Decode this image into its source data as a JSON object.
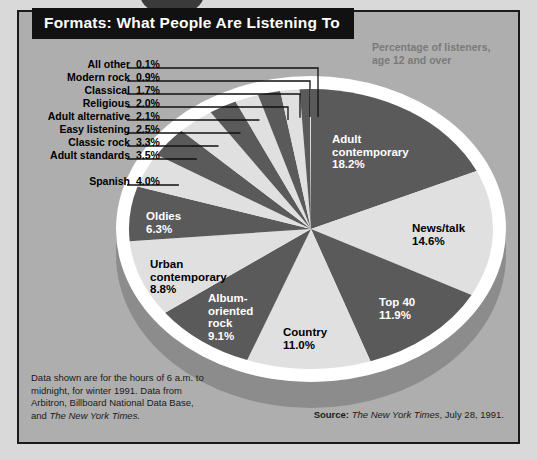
{
  "title": "Formats: What People Are Listening To",
  "subtitle": "Percentage of listeners,\nage 12 and over",
  "subtitle_line1": "Percentage of listeners,",
  "subtitle_line2": "age 12 and over",
  "footnote": "Data shown are for the hours of 6 a.m. to midnight, for winter 1991. Data from Arbitron, Billboard National Data Base, and ",
  "footnote_italic": "The New York Times.",
  "source_label": "Source:",
  "source_italic": "The New York Times",
  "source_rest": ", July 28, 1991.",
  "colors": {
    "panel_background": "#aeaeae",
    "page_background": "#d9d9d9",
    "slice_dark": "#5a5a5a",
    "slice_light": "#e0e0e0",
    "pie_rim": "#ffffff",
    "pie_side": "#8c8c8c",
    "title_background": "#111111",
    "title_text": "#ffffff",
    "subtitle_text": "#7a7a7a",
    "leader_line": "#111111"
  },
  "left_labels": [
    {
      "name": "All other",
      "value": "0.1%"
    },
    {
      "name": "Modern rock",
      "value": "0.9%"
    },
    {
      "name": "Classical",
      "value": "1.7%"
    },
    {
      "name": "Religious",
      "value": "2.0%"
    },
    {
      "name": "Adult alternative",
      "value": "2.1%"
    },
    {
      "name": "Easy listening",
      "value": "2.5%"
    },
    {
      "name": "Classic rock",
      "value": "3.3%"
    },
    {
      "name": "Adult standards",
      "value": "3.5%"
    },
    {
      "name": "Spanish",
      "value": "4.0%"
    }
  ],
  "slice_labels": [
    {
      "id": "adult-contemporary",
      "line1": "Adult",
      "line2": "contemporary",
      "line3": "18.2%",
      "tone": "w"
    },
    {
      "id": "news-talk",
      "line1": "News/talk",
      "line2": "14.6%",
      "line3": "",
      "tone": "b"
    },
    {
      "id": "top-40",
      "line1": "Top 40",
      "line2": "11.9%",
      "line3": "",
      "tone": "w"
    },
    {
      "id": "country",
      "line1": "Country",
      "line2": "11.0%",
      "line3": "",
      "tone": "b"
    },
    {
      "id": "album-oriented-rock",
      "line1": "Album-",
      "line2": "oriented",
      "line3": "rock",
      "line4": "9.1%",
      "tone": "w"
    },
    {
      "id": "urban-contemporary",
      "line1": "Urban",
      "line2": "contemporary",
      "line3": "8.8%",
      "tone": "b"
    },
    {
      "id": "oldies",
      "line1": "Oldies",
      "line2": "6.3%",
      "line3": "",
      "tone": "w"
    }
  ],
  "chart_data": {
    "type": "pie",
    "title": "Formats: What People Are Listening To",
    "subtitle": "Percentage of listeners, age 12 and over",
    "unit": "percent",
    "legend": "labels on slices and leader lines",
    "categories": [
      "Adult contemporary",
      "News/talk",
      "Top 40",
      "Country",
      "Album-oriented rock",
      "Urban contemporary",
      "Oldies",
      "Spanish",
      "Adult standards",
      "Classic rock",
      "Easy listening",
      "Adult alternative",
      "Religious",
      "Classical",
      "Modern rock",
      "All other"
    ],
    "values": [
      18.2,
      14.6,
      11.9,
      11.0,
      9.1,
      8.8,
      6.3,
      4.0,
      3.5,
      3.3,
      2.5,
      2.1,
      2.0,
      1.7,
      0.9,
      0.1
    ],
    "value_labels": [
      "18.2%",
      "14.6%",
      "11.9%",
      "11.0%",
      "9.1%",
      "8.8%",
      "6.3%",
      "4.0%",
      "3.5%",
      "3.3%",
      "2.5%",
      "2.1%",
      "2.0%",
      "1.7%",
      "0.9%",
      "0.1%"
    ],
    "slice_colors": [
      "#5a5a5a",
      "#e0e0e0",
      "#5a5a5a",
      "#e0e0e0",
      "#5a5a5a",
      "#e0e0e0",
      "#5a5a5a",
      "#e0e0e0",
      "#5a5a5a",
      "#e0e0e0",
      "#5a5a5a",
      "#e0e0e0",
      "#5a5a5a",
      "#e0e0e0",
      "#5a5a5a",
      "#e0e0e0"
    ],
    "start_angle_deg": -90,
    "direction": "clockwise",
    "total": 100.0
  }
}
